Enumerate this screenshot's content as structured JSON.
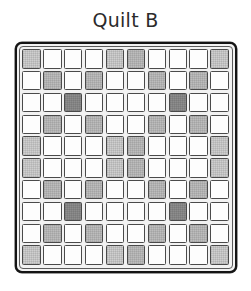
{
  "figure": {
    "title": "Quilt B",
    "width": 251,
    "height": 291
  },
  "colors": {
    "background": "#ffffff",
    "title_text": "#2b2b2b",
    "frame_border": "#141414",
    "frame_fill": "#f2f2f2",
    "patch_border": "#4a4a4a",
    "shade_white": "#fdfdfd",
    "shade_light": "#cfcfcf",
    "shade_medium": "#bdbdbd",
    "shade_dark": "#8d8d8d"
  },
  "chart_data": {
    "type": "heatmap",
    "title": "Quilt B",
    "xlabel": "",
    "ylabel": "",
    "rows": 10,
    "cols": 10,
    "value_labels": {
      "0": "white",
      "1": "light",
      "2": "medium",
      "3": "dark"
    },
    "legend": [
      {
        "label": "white",
        "color": "#fdfdfd",
        "value": 0
      },
      {
        "label": "light",
        "color": "#cfcfcf",
        "value": 1
      },
      {
        "label": "medium",
        "color": "#bdbdbd",
        "value": 2
      },
      {
        "label": "dark",
        "color": "#8d8d8d",
        "value": 3
      }
    ],
    "grid": [
      [
        1,
        0,
        0,
        0,
        1,
        2,
        0,
        0,
        0,
        1
      ],
      [
        0,
        2,
        0,
        2,
        0,
        0,
        2,
        0,
        2,
        0
      ],
      [
        0,
        0,
        3,
        0,
        0,
        0,
        0,
        3,
        0,
        0
      ],
      [
        0,
        2,
        0,
        2,
        0,
        0,
        2,
        0,
        2,
        0
      ],
      [
        1,
        0,
        0,
        0,
        1,
        2,
        0,
        0,
        0,
        1
      ],
      [
        1,
        0,
        0,
        0,
        1,
        2,
        0,
        0,
        0,
        1
      ],
      [
        0,
        2,
        0,
        2,
        0,
        0,
        2,
        0,
        2,
        0
      ],
      [
        0,
        0,
        3,
        0,
        0,
        0,
        0,
        3,
        0,
        0
      ],
      [
        0,
        2,
        0,
        2,
        0,
        0,
        2,
        0,
        2,
        0
      ],
      [
        1,
        0,
        0,
        0,
        1,
        2,
        0,
        0,
        0,
        1
      ]
    ],
    "counts": {
      "white": 60,
      "light": 12,
      "medium": 24,
      "dark": 4
    }
  }
}
